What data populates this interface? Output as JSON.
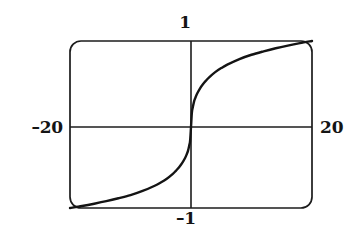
{
  "figure": {
    "kind": "math-function-plot",
    "background_color": "#ffffff",
    "ink_color": "#141414",
    "frame": {
      "shape": "rounded-rectangle",
      "corner_radius": 11,
      "left": 70,
      "top": 41,
      "right": 312,
      "bottom": 208
    },
    "axes": {
      "x_axis_y": 127,
      "y_axis_x": 191,
      "grid": false
    },
    "labels": {
      "x_min": "–20",
      "x_max": "20",
      "y_max": "1",
      "y_min": "–1"
    }
  },
  "chart_data": {
    "type": "line",
    "title": "",
    "subtitle": "",
    "xlabel": "",
    "ylabel": "",
    "xlim": [
      -20,
      20
    ],
    "ylim": [
      -1,
      1
    ],
    "xticks": [
      -20,
      20
    ],
    "yticks": [
      -1,
      1
    ],
    "xticklabels": [
      "–20",
      "20"
    ],
    "yticklabels": [
      "–1",
      "1"
    ],
    "grid": false,
    "legend": null,
    "legend_position": "none",
    "annotations": [],
    "series": [
      {
        "name": "y = f(x)",
        "x": [
          -20,
          -18,
          -16,
          -14,
          -12,
          -10,
          -8,
          -6,
          -5,
          -4,
          -3,
          -2.5,
          -2,
          -1.5,
          -1,
          -0.7,
          -0.5,
          -0.3,
          -0.15,
          0,
          0.15,
          0.3,
          0.5,
          0.7,
          1,
          1.5,
          2,
          2.5,
          3,
          4,
          5,
          6,
          8,
          10,
          12,
          14,
          16,
          18,
          20
        ],
        "y": [
          -1.0,
          -0.975,
          -0.947,
          -0.916,
          -0.88,
          -0.84,
          -0.79,
          -0.725,
          -0.685,
          -0.638,
          -0.578,
          -0.541,
          -0.5,
          -0.45,
          -0.386,
          -0.336,
          -0.295,
          -0.23,
          -0.17,
          0.0,
          0.17,
          0.23,
          0.295,
          0.336,
          0.386,
          0.45,
          0.5,
          0.541,
          0.578,
          0.638,
          0.685,
          0.725,
          0.79,
          0.84,
          0.88,
          0.916,
          0.947,
          0.975,
          1.0
        ]
      }
    ]
  }
}
